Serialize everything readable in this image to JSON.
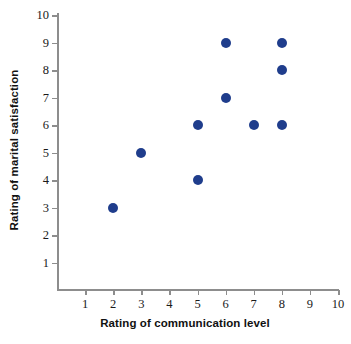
{
  "chart_data": {
    "type": "scatter",
    "title": "",
    "xlabel": "Rating of communication level",
    "ylabel": "Rating of marital satisfaction",
    "xlim": [
      0,
      10
    ],
    "ylim": [
      0,
      10
    ],
    "xticks": [
      1,
      2,
      3,
      4,
      5,
      6,
      7,
      8,
      9,
      10
    ],
    "yticks": [
      1,
      2,
      3,
      4,
      5,
      6,
      7,
      8,
      9,
      10
    ],
    "xtick_labels": [
      "1",
      "2",
      "3",
      "4",
      "5",
      "6",
      "7",
      "8",
      "9",
      "10"
    ],
    "ytick_labels": [
      "1",
      "2",
      "3",
      "4",
      "5",
      "6",
      "7",
      "8",
      "9",
      "10"
    ],
    "grid": false,
    "legend": null,
    "marker_color": "#1f3d8c",
    "marker_size": 10,
    "points": [
      {
        "x": 2,
        "y": 3
      },
      {
        "x": 3,
        "y": 5
      },
      {
        "x": 5,
        "y": 4
      },
      {
        "x": 5,
        "y": 6
      },
      {
        "x": 6,
        "y": 7
      },
      {
        "x": 6,
        "y": 9
      },
      {
        "x": 7,
        "y": 6
      },
      {
        "x": 8,
        "y": 6
      },
      {
        "x": 8,
        "y": 8
      },
      {
        "x": 8,
        "y": 9
      }
    ]
  },
  "colors": {
    "marker": "#1f3d8c",
    "axis": "#8d8d8d",
    "text": "#111111",
    "background": "#ffffff"
  }
}
